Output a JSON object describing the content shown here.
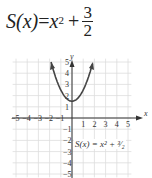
{
  "title": {
    "lhs": "S(x)",
    "rhs_base": "x",
    "rhs_exp": "2",
    "plus": "+",
    "frac_num": "3",
    "frac_den": "2"
  },
  "curve_label": "S(x) = x² + ³⁄₂",
  "chart_data": {
    "type": "line",
    "xlabel": "x",
    "ylabel": "y",
    "xlim": [
      -5,
      5
    ],
    "ylim": [
      -5,
      5
    ],
    "grid": true,
    "x_ticks": [
      -5,
      -4,
      -3,
      -2,
      -1,
      1,
      2,
      3,
      4,
      5
    ],
    "y_ticks": [
      -5,
      -4,
      -3,
      -2,
      -1,
      1,
      2,
      3,
      4,
      5
    ],
    "series": [
      {
        "name": "S(x) = x^2 + 3/2",
        "x": [
          -1.87,
          -1.5,
          -1,
          -0.5,
          0,
          0.5,
          1,
          1.5,
          1.87
        ],
        "y": [
          5,
          3.75,
          2.5,
          1.75,
          1.5,
          1.75,
          2.5,
          3.75,
          5
        ]
      }
    ],
    "annotations": [
      "S(x) = x^2 + 3/2"
    ]
  }
}
